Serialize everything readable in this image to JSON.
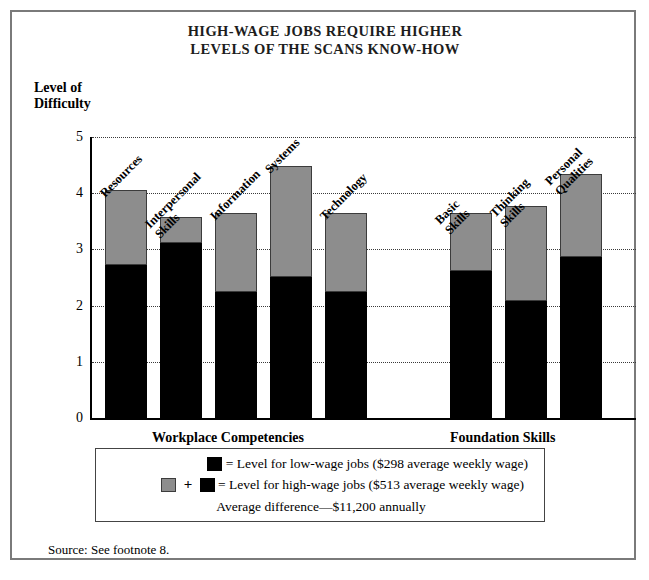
{
  "title": {
    "line1": "HIGH-WAGE JOBS REQUIRE HIGHER",
    "line2": "LEVELS OF THE SCANS KNOW-HOW"
  },
  "axis": {
    "ylabel_line1": "Level of",
    "ylabel_line2": "Difficulty",
    "yticks": [
      "5",
      "4",
      "3",
      "2",
      "1",
      "0"
    ]
  },
  "groups": [
    {
      "caption": "Workplace Competencies"
    },
    {
      "caption": "Foundation Skills"
    }
  ],
  "legend": {
    "row1_text": "= Level for low-wage jobs  ($298 average weekly wage)",
    "row2_text": "= Level for high-wage jobs  ($513 average weekly wage)",
    "row3_text": "Average difference—$11,200 annually",
    "plus": "+"
  },
  "source": "Source: See footnote 8.",
  "colors": {
    "low_wage": "#000000",
    "high_wage": "#8d8d8d",
    "frame": "#7a7a7a"
  },
  "chart_data": {
    "type": "bar",
    "title": "HIGH-WAGE JOBS REQUIRE HIGHER LEVELS OF THE SCANS KNOW-HOW",
    "xlabel": "",
    "ylabel": "Level of Difficulty",
    "ylim": [
      0,
      5
    ],
    "yticks": [
      0,
      1,
      2,
      3,
      4,
      5
    ],
    "grid": "horizontal-dotted",
    "stacked": true,
    "legend_position": "below-plot",
    "categories": [
      "Resources",
      "Interpersonal Skills",
      "Information",
      "Systems",
      "Technology",
      "Basic Skills",
      "Thinking Skills",
      "Personal Qualities"
    ],
    "category_groups": [
      {
        "name": "Workplace Competencies",
        "categories": [
          "Resources",
          "Interpersonal Skills",
          "Information",
          "Systems",
          "Technology"
        ]
      },
      {
        "name": "Foundation Skills",
        "categories": [
          "Basic Skills",
          "Thinking Skills",
          "Personal Qualities"
        ]
      }
    ],
    "series": [
      {
        "name": "Level for low-wage jobs ($298 average weekly wage)",
        "color": "#000000",
        "values": [
          2.72,
          3.12,
          2.25,
          2.5,
          2.25,
          2.62,
          2.08,
          2.87
        ]
      },
      {
        "name": "Level for high-wage jobs ($513 average weekly wage)",
        "color": "#8d8d8d",
        "totals": [
          4.05,
          3.57,
          3.65,
          4.48,
          3.65,
          3.65,
          3.78,
          4.35
        ]
      }
    ],
    "annotation": "Average difference—$11,200 annually",
    "source": "Source: See footnote 8."
  }
}
